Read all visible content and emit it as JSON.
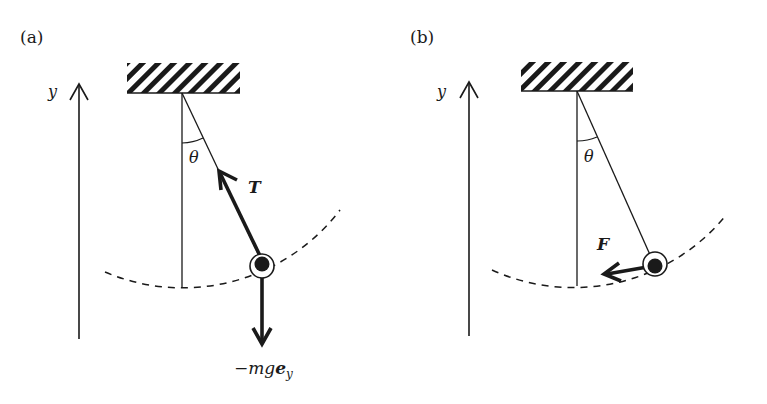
{
  "figure": {
    "type": "physics-diagram"
  },
  "panels": [
    {
      "id": "a",
      "label": "(a)",
      "axis_label": "y",
      "angle_label": "θ",
      "forces": [
        {
          "name": "tension",
          "label": "T",
          "style": "bold-italic"
        },
        {
          "name": "gravity",
          "label_prefix": "−mg",
          "label_vector": "e",
          "label_subscript": "y"
        }
      ]
    },
    {
      "id": "b",
      "label": "(b)",
      "axis_label": "y",
      "angle_label": "θ",
      "forces": [
        {
          "name": "net-force",
          "label": "F",
          "style": "bold-italic"
        }
      ]
    }
  ],
  "colors": {
    "ink": "#1a1a1a",
    "background": "#ffffff"
  }
}
